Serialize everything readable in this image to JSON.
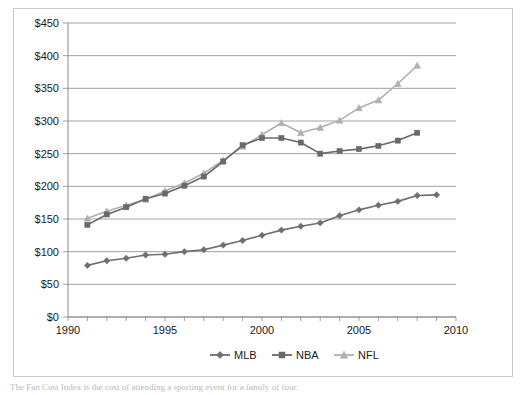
{
  "chart_data": {
    "type": "line",
    "title": "",
    "subtitle": "",
    "xlabel": "",
    "ylabel": "",
    "xlim": [
      1990,
      2010
    ],
    "ylim": [
      0,
      450
    ],
    "grid": true,
    "legend_position": "bottom",
    "y_ticks": [
      0,
      50,
      100,
      150,
      200,
      250,
      300,
      350,
      400,
      450
    ],
    "y_tick_labels": [
      "$0",
      "$50",
      "$100",
      "$150",
      "$200",
      "$250",
      "$300",
      "$350",
      "$400",
      "$450"
    ],
    "x_ticks": [
      1990,
      1995,
      2000,
      2005,
      2010
    ],
    "x_tick_labels": [
      "1990",
      "1995",
      "2000",
      "2005",
      "2010"
    ],
    "x_minor_tick_step": 1,
    "series": [
      {
        "name": "MLB",
        "color": "#6f6f6f",
        "marker": "diamond",
        "x": [
          1991,
          1992,
          1993,
          1994,
          1995,
          1996,
          1997,
          1998,
          1999,
          2000,
          2001,
          2002,
          2003,
          2004,
          2005,
          2006,
          2007,
          2008,
          2009
        ],
        "values": [
          79,
          86,
          90,
          95,
          96,
          100,
          103,
          110,
          117,
          125,
          133,
          139,
          144,
          155,
          164,
          171,
          177,
          186,
          187
        ]
      },
      {
        "name": "NBA",
        "color": "#696969",
        "marker": "square",
        "x": [
          1991,
          1992,
          1993,
          1994,
          1995,
          1996,
          1997,
          1998,
          1999,
          2000,
          2001,
          2002,
          2003,
          2004,
          2005,
          2006,
          2007,
          2008
        ],
        "values": [
          141,
          157,
          168,
          181,
          189,
          201,
          215,
          238,
          263,
          274,
          274,
          267,
          250,
          254,
          257,
          262,
          270,
          282
        ]
      },
      {
        "name": "NFL",
        "color": "#b0b0b0",
        "marker": "triangle",
        "x": [
          1991,
          1992,
          1993,
          1994,
          1995,
          1996,
          1997,
          1998,
          1999,
          2000,
          2001,
          2002,
          2003,
          2004,
          2005,
          2006,
          2007,
          2008
        ],
        "values": [
          151,
          162,
          171,
          180,
          193,
          205,
          220,
          240,
          261,
          279,
          297,
          282,
          290,
          301,
          320,
          332,
          357,
          385
        ]
      }
    ]
  },
  "legend": {
    "items": [
      {
        "label": "MLB"
      },
      {
        "label": "NBA"
      },
      {
        "label": "NFL"
      }
    ]
  },
  "caption": {
    "text": "The Fan Cost Index is the cost of attending a sporting event for a family of four."
  }
}
